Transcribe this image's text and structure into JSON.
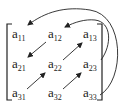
{
  "diagram": {
    "type": "matrix-traversal",
    "colors": {
      "ink": "#222222",
      "background": "#ffffff"
    },
    "matrix": {
      "rows": [
        [
          {
            "base": "a",
            "sub": "11"
          },
          {
            "base": "a",
            "sub": "12"
          },
          {
            "base": "a",
            "sub": "13"
          }
        ],
        [
          {
            "base": "a",
            "sub": "21"
          },
          {
            "base": "a",
            "sub": "22"
          },
          {
            "base": "a",
            "sub": "23"
          }
        ],
        [
          {
            "base": "a",
            "sub": "31"
          },
          {
            "base": "a",
            "sub": "32"
          },
          {
            "base": "a",
            "sub": "33"
          }
        ]
      ]
    },
    "arrows": [
      {
        "from": "a33",
        "to": "a11",
        "style": "outer-curve"
      },
      {
        "from": "a23",
        "to": "a12",
        "style": "inner-curve"
      },
      {
        "from": "a12",
        "to": "a21",
        "style": "straight"
      },
      {
        "from": "a31",
        "to": "a22",
        "style": "straight"
      },
      {
        "from": "a22",
        "to": "a13",
        "style": "straight"
      },
      {
        "from": "a32",
        "to": "a23",
        "style": "straight"
      }
    ]
  }
}
